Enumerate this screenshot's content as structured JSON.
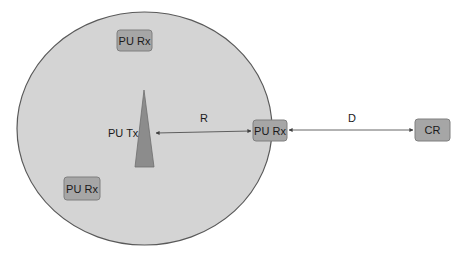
{
  "diagram": {
    "type": "cognitive-radio-coverage",
    "colors": {
      "background": "#ffffff",
      "coverage_fill": "#d4d4d4",
      "coverage_stroke": "#595959",
      "node_fill": "#a6a6a6",
      "node_stroke": "#7f7f7f",
      "transmitter_fill": "#8c8c8c",
      "arrow": "#404040",
      "text": "#1a1a1a"
    },
    "coverage_area": {
      "cx": 144.5,
      "cy": 128.5,
      "rx": 127.5,
      "ry": 116.5
    },
    "transmitter": {
      "label": "PU Tx",
      "apex": [
        144,
        90
      ],
      "base_left": [
        135,
        167
      ],
      "base_right": [
        154,
        167
      ]
    },
    "nodes": [
      {
        "id": "pu-rx-top",
        "label": "PU Rx",
        "x": 117,
        "y": 30,
        "w": 35,
        "h": 21
      },
      {
        "id": "pu-rx-bottom-left",
        "label": "PU Rx",
        "x": 64,
        "y": 177,
        "w": 36,
        "h": 23
      },
      {
        "id": "pu-rx-edge",
        "label": "PU Rx",
        "x": 253,
        "y": 120,
        "w": 34,
        "h": 21
      },
      {
        "id": "cr",
        "label": "CR",
        "x": 415,
        "y": 119,
        "w": 35,
        "h": 22
      }
    ],
    "links": [
      {
        "id": "link-r",
        "label": "R",
        "from": "PU Tx",
        "to": "PU Rx",
        "x1": 155,
        "y1": 133,
        "x2": 252,
        "y2": 131
      },
      {
        "id": "link-d",
        "label": "D",
        "from": "PU Rx",
        "to": "CR",
        "x1": 288,
        "y1": 130,
        "x2": 414,
        "y2": 130
      }
    ]
  }
}
